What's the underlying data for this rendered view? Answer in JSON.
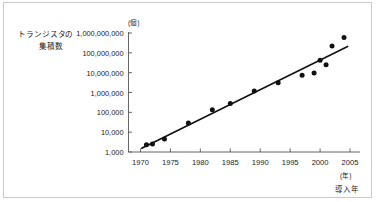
{
  "figure": {
    "background_color": "#ffffff",
    "frame_color": "#c9c9c9",
    "ink_color": "#1a1a1a"
  },
  "axis_titles": {
    "y_line1": "トランジスタの",
    "y_line2": "集積数",
    "y_unit": "(個)",
    "x_unit": "(年)",
    "x_title": "導入年"
  },
  "chart_data": {
    "type": "scatter",
    "title": "",
    "subtitle": "",
    "xlabel": "導入年",
    "ylabel": "トランジスタの集積数",
    "x_unit": "(年)",
    "y_unit": "(個)",
    "yscale": "log",
    "xscale": "linear",
    "xlim": [
      1968,
      2006
    ],
    "ylim": [
      1000,
      1000000000
    ],
    "grid": false,
    "legend": null,
    "ytick_labels": [
      "1,000",
      "10,000",
      "100,000",
      "1,000,000",
      "10,000,000",
      "100,000,000",
      "1,000,000,000"
    ],
    "ytick_values": [
      1000,
      10000,
      100000,
      1000000,
      10000000,
      100000000,
      1000000000
    ],
    "xtick_labels": [
      "1970",
      "1975",
      "1980",
      "1985",
      "1990",
      "1995",
      "2000",
      "2005"
    ],
    "xtick_values": [
      1970,
      1975,
      1980,
      1985,
      1990,
      1995,
      2000,
      2005
    ],
    "marker": "filled-circle",
    "marker_color": "#111111",
    "marker_size_px": 5,
    "points": [
      {
        "x": 1971,
        "y": 2300
      },
      {
        "x": 1972,
        "y": 2500
      },
      {
        "x": 1974,
        "y": 4500
      },
      {
        "x": 1978,
        "y": 29000
      },
      {
        "x": 1982,
        "y": 134000
      },
      {
        "x": 1985,
        "y": 275000
      },
      {
        "x": 1989,
        "y": 1200000
      },
      {
        "x": 1993,
        "y": 3100000
      },
      {
        "x": 1997,
        "y": 7500000
      },
      {
        "x": 1999,
        "y": 9500000
      },
      {
        "x": 2000,
        "y": 42000000
      },
      {
        "x": 2001,
        "y": 25000000
      },
      {
        "x": 2002,
        "y": 220000000
      },
      {
        "x": 2004,
        "y": 592000000
      }
    ],
    "trend_line": {
      "style": "solid",
      "color": "#111111",
      "width_px": 1.6,
      "x_start": 1970.2,
      "y_start": 1550,
      "x_end": 2004.6,
      "y_end": 210000000
    }
  }
}
